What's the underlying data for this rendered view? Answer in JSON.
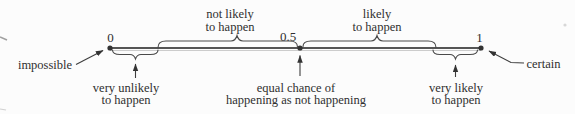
{
  "number_line": {
    "tick_0": "0",
    "tick_mid": "0.5",
    "tick_1": "1",
    "left_endpoint_label": "impossible",
    "right_endpoint_label": "certain"
  },
  "labels": {
    "not_likely": {
      "line1": "not likely",
      "line2": "to happen"
    },
    "likely": {
      "line1": "likely",
      "line2": "to happen"
    },
    "very_unlikely": {
      "line1": "very unlikely",
      "line2": "to happen"
    },
    "equal_chance": {
      "line1": "equal chance of",
      "line2": "happening as not happening"
    },
    "very_likely": {
      "line1": "very likely",
      "line2": "to happen"
    }
  },
  "colors": {
    "ink": "#2f2f2f",
    "line": "#555555",
    "background": "#fcfcfc"
  }
}
